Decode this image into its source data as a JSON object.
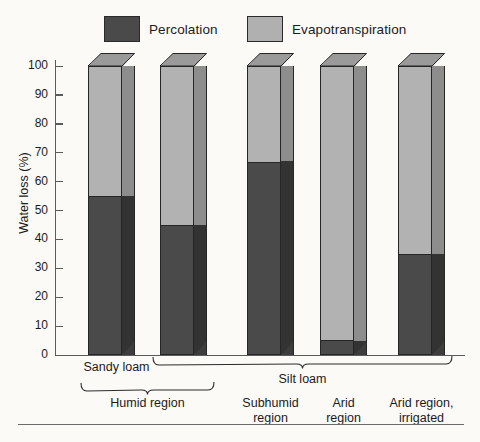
{
  "legend": {
    "items": [
      {
        "key": "percolation",
        "label": "Percolation",
        "color": "#4a4a4a"
      },
      {
        "key": "evapotranspiration",
        "label": "Evapotranspiration",
        "color": "#b0b0b0"
      }
    ]
  },
  "axis": {
    "ylabel": "Water loss (%)",
    "ticks": [
      "100",
      "90",
      "80",
      "70",
      "60",
      "50",
      "40",
      "30",
      "20",
      "10",
      "0"
    ]
  },
  "soil_groups": [
    {
      "label": "Sandy loam",
      "bars": [
        0
      ]
    },
    {
      "label": "Silt loam",
      "bars": [
        1,
        2,
        3,
        4
      ]
    }
  ],
  "region_groups": [
    {
      "label": "Humid region",
      "bars": [
        0,
        1
      ],
      "braced": true
    },
    {
      "label": "Subhumid\nregion",
      "line1": "Subhumid",
      "line2": "region",
      "bars": [
        2
      ],
      "braced": false
    },
    {
      "label": "Arid\nregion",
      "line1": "Arid",
      "line2": "region",
      "bars": [
        3
      ],
      "braced": false
    },
    {
      "label": "Arid region,\nirrigated",
      "line1": "Arid region,",
      "line2": "irrigated",
      "bars": [
        4
      ],
      "braced": false
    }
  ],
  "chart_data": {
    "type": "bar",
    "subtype": "stacked-3d",
    "title": "",
    "xlabel": "",
    "ylabel": "Water loss (%)",
    "ylim": [
      0,
      100
    ],
    "yticks": [
      0,
      10,
      20,
      30,
      40,
      50,
      60,
      70,
      80,
      90,
      100
    ],
    "grid": false,
    "legend_position": "top",
    "categories": [
      "Sandy loam / Humid region",
      "Silt loam / Humid region",
      "Silt loam / Subhumid region",
      "Silt loam / Arid region",
      "Silt loam / Arid region, irrigated"
    ],
    "series": [
      {
        "name": "Percolation",
        "color": "#4a4a4a",
        "values": [
          55,
          45,
          67,
          5,
          35
        ]
      },
      {
        "name": "Evapotranspiration",
        "color": "#b0b0b0",
        "values": [
          45,
          55,
          33,
          95,
          65
        ]
      }
    ]
  }
}
